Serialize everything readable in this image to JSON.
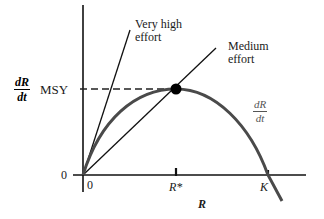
{
  "diagram": {
    "type": "harvest-yield-curve",
    "y_axis_label_numerator": "dR",
    "y_axis_label_denominator": "dt",
    "msy_label": "MSY",
    "x_axis_label": "R",
    "origin_x_label": "0",
    "origin_y_label": "0",
    "r_star_label": "R*",
    "k_label": "K",
    "curve_label_numerator": "dR",
    "curve_label_denominator": "dt",
    "lines": [
      {
        "label_line1": "Very high",
        "label_line2": "effort"
      },
      {
        "label_line1": "Medium",
        "label_line2": "effort"
      }
    ],
    "colors": {
      "axis": "#111111",
      "curve": "#4a4a4a",
      "effort_lines": "#111111",
      "dashed": "#222222",
      "curve_label": "#555555"
    }
  }
}
